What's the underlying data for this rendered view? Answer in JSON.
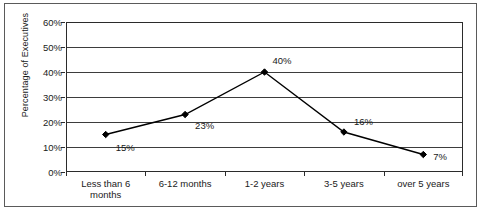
{
  "chart_data": {
    "type": "line",
    "title": "",
    "xlabel": "",
    "ylabel": "Percentage of Executives",
    "categories": [
      "Less than 6 months",
      "6-12 months",
      "1-2 years",
      "3-5 years",
      "over 5 years"
    ],
    "values": [
      15,
      23,
      40,
      16,
      7
    ],
    "point_labels": [
      "15%",
      "23%",
      "40%",
      "16%",
      "7%"
    ],
    "ylim": [
      0,
      60
    ],
    "ytick_values": [
      0,
      10,
      20,
      30,
      40,
      50,
      60
    ],
    "ytick_labels": [
      "0%",
      "10%",
      "20%",
      "30%",
      "40%",
      "50%",
      "60%"
    ],
    "grid": true,
    "legend": false,
    "series_color": "#000000",
    "marker": "diamond",
    "label_offsets": [
      {
        "dx": 10,
        "dy": 12
      },
      {
        "dx": 10,
        "dy": 10
      },
      {
        "dx": 8,
        "dy": -12
      },
      {
        "dx": 10,
        "dy": -11
      },
      {
        "dx": 10,
        "dy": 1
      }
    ]
  },
  "colors": {
    "line": "#000000",
    "marker": "#000000",
    "grid": "#3d3d3d",
    "axis": "#2b2b2b",
    "frame": "#5a5a5a",
    "text": "#1a1a1a",
    "background": "#ffffff"
  }
}
